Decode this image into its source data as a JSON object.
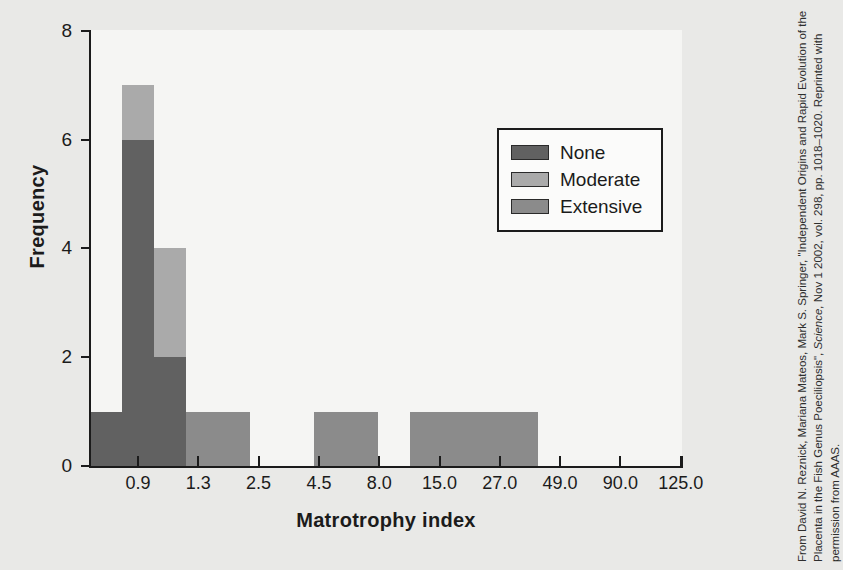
{
  "chart_data": {
    "type": "bar",
    "title": "",
    "xlabel": "Matrotrophy index",
    "ylabel": "Frequency",
    "ylim": [
      0,
      8
    ],
    "yticks": [
      0,
      2,
      4,
      6,
      8
    ],
    "ytick_labels": [
      "0",
      "2",
      "4",
      "6",
      "8"
    ],
    "xtick_labels": [
      "0.9",
      "1.3",
      "2.5",
      "4.5",
      "8.0",
      "15.0",
      "27.0",
      "49.0",
      "90.0",
      "125.0"
    ],
    "grid": false,
    "legend_position": "upper-right",
    "stacked": true,
    "series": [
      {
        "name": "None",
        "color": "#616161"
      },
      {
        "name": "Moderate",
        "color": "#aaaaaa"
      },
      {
        "name": "Extensive",
        "color": "#8b8b8b"
      }
    ],
    "bins": [
      {
        "index": 0,
        "none": 1,
        "moderate": 0,
        "extensive": 0,
        "total": 1
      },
      {
        "index": 1,
        "none": 6,
        "moderate": 1,
        "extensive": 0,
        "total": 7
      },
      {
        "index": 2,
        "none": 2,
        "moderate": 2,
        "extensive": 0,
        "total": 4
      },
      {
        "index": 3,
        "none": 0,
        "moderate": 0,
        "extensive": 1,
        "total": 1
      },
      {
        "index": 4,
        "none": 0,
        "moderate": 0,
        "extensive": 1,
        "total": 1
      },
      {
        "index": 5,
        "none": 0,
        "moderate": 0,
        "extensive": 0,
        "total": 0
      },
      {
        "index": 6,
        "none": 0,
        "moderate": 0,
        "extensive": 0,
        "total": 0
      },
      {
        "index": 7,
        "none": 0,
        "moderate": 0,
        "extensive": 1,
        "total": 1
      },
      {
        "index": 8,
        "none": 0,
        "moderate": 0,
        "extensive": 1,
        "total": 1
      },
      {
        "index": 9,
        "none": 0,
        "moderate": 0,
        "extensive": 0,
        "total": 0
      },
      {
        "index": 10,
        "none": 0,
        "moderate": 0,
        "extensive": 1,
        "total": 1
      },
      {
        "index": 11,
        "none": 0,
        "moderate": 0,
        "extensive": 1,
        "total": 1
      },
      {
        "index": 12,
        "none": 0,
        "moderate": 0,
        "extensive": 1,
        "total": 1
      },
      {
        "index": 13,
        "none": 0,
        "moderate": 0,
        "extensive": 1,
        "total": 1
      }
    ]
  },
  "legend": {
    "entries": [
      {
        "label": "None",
        "color": "#616161"
      },
      {
        "label": "Moderate",
        "color": "#aaaaaa"
      },
      {
        "label": "Extensive",
        "color": "#8b8b8b"
      }
    ]
  },
  "credit": {
    "line1": "From David N. Reznick, Mariana Mateos, Mark S. Springer, \"Independent Origins",
    "line2": "and Rapid Evolution of the Placenta in the Fish Genus Poeciliopsis\", ",
    "line2_italic": "Science,",
    "line3": "Nov 1 2002, vol. 298, pp. 1018–1020. Reprinted with permission from AAAS."
  },
  "colors": {
    "page_background": "#e9e9e7",
    "plot_background": "#f5f5f3",
    "axis": "#1b1b1b",
    "text": "#1b1b1b"
  }
}
